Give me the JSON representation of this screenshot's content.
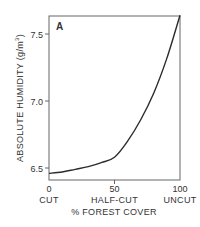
{
  "chart_data": {
    "type": "line",
    "panel_label": "A",
    "title": "",
    "xlabel": "% FOREST COVER",
    "ylabel": "ABSOLUTE HUMIDITY (g/m³)",
    "ylabel_main": "ABSOLUTE HUMIDITY (g/m",
    "ylabel_sup": "3",
    "ylabel_close": ")",
    "xlim": [
      0,
      100
    ],
    "ylim": [
      6.41,
      7.63
    ],
    "x_ticks": [
      {
        "value": 0,
        "label": "0",
        "sublabel": "CUT"
      },
      {
        "value": 50,
        "label": "50",
        "sublabel": "HALF-CUT"
      },
      {
        "value": 100,
        "label": "100",
        "sublabel": "UNCUT"
      }
    ],
    "y_ticks": [
      {
        "value": 6.5,
        "label": "6.5"
      },
      {
        "value": 7.0,
        "label": "7.0"
      },
      {
        "value": 7.5,
        "label": "7.5"
      }
    ],
    "grid": false,
    "legend": null,
    "series": [
      {
        "name": "Absolute humidity",
        "x": [
          0,
          10,
          20,
          30,
          40,
          50,
          60,
          70,
          80,
          90,
          100
        ],
        "values": [
          6.46,
          6.47,
          6.49,
          6.51,
          6.54,
          6.58,
          6.7,
          6.86,
          7.06,
          7.32,
          7.64
        ]
      }
    ]
  },
  "colors": {
    "line": "#2b2b2b",
    "axis": "#555555",
    "text": "#333333",
    "background": "#ffffff"
  }
}
